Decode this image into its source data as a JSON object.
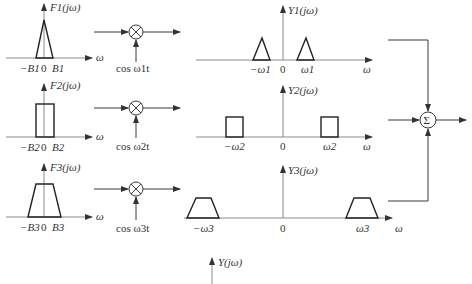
{
  "diagram": {
    "inputs": [
      {
        "spectrum_label": "F1(jω)",
        "shape": "triangle",
        "tick_neg": "−B1",
        "tick_zero": "0",
        "tick_pos": "B1",
        "axis_label": "ω"
      },
      {
        "spectrum_label": "F2(jω)",
        "shape": "rectangle",
        "tick_neg": "−B2",
        "tick_zero": "0",
        "tick_pos": "B2",
        "axis_label": "ω"
      },
      {
        "spectrum_label": "F3(jω)",
        "shape": "trapezoid",
        "tick_neg": "−B3",
        "tick_zero": "0",
        "tick_pos": "B3",
        "axis_label": "ω"
      }
    ],
    "multipliers": [
      {
        "symbol": "⊗",
        "carrier": "cos ω1t"
      },
      {
        "symbol": "⊗",
        "carrier": "cos ω2t"
      },
      {
        "symbol": "⊗",
        "carrier": "cos ω3t"
      }
    ],
    "outputs": [
      {
        "spectrum_label": "Y1(jω)",
        "tick_neg": "−ω1",
        "tick_zero": "0",
        "tick_pos": "ω1",
        "axis_label": "ω"
      },
      {
        "spectrum_label": "Y2(jω)",
        "tick_neg": "−ω2",
        "tick_zero": "0",
        "tick_pos": "ω2",
        "axis_label": "ω"
      },
      {
        "spectrum_label": "Y3(jω)",
        "tick_neg": "−ω3",
        "tick_zero": "0",
        "tick_pos": "ω3",
        "axis_label": "ω"
      }
    ],
    "summer": {
      "symbol": "Σ"
    },
    "result": {
      "spectrum_label": "Y(jω)"
    }
  }
}
